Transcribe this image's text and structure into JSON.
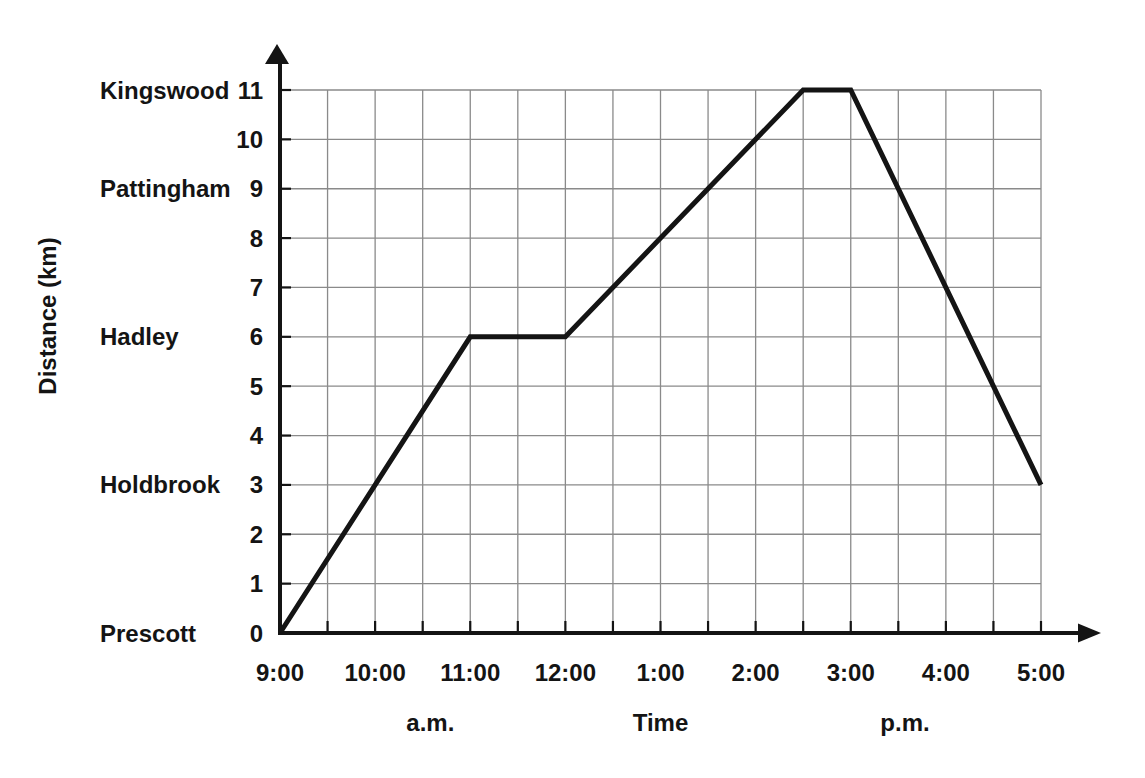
{
  "chart_data": {
    "type": "line",
    "title": "",
    "xlabel": "Time",
    "ylabel": "Distance (km)",
    "grid": true,
    "legend": false,
    "x_axis": {
      "range_hours": [
        9,
        17
      ],
      "grid_step_hours": 0.5,
      "ticks": [
        {
          "hour": 9,
          "label": "9:00"
        },
        {
          "hour": 10,
          "label": "10:00"
        },
        {
          "hour": 11,
          "label": "11:00"
        },
        {
          "hour": 12,
          "label": "12:00"
        },
        {
          "hour": 13,
          "label": "1:00"
        },
        {
          "hour": 14,
          "label": "2:00"
        },
        {
          "hour": 15,
          "label": "3:00"
        },
        {
          "hour": 16,
          "label": "4:00"
        },
        {
          "hour": 17,
          "label": "5:00"
        }
      ],
      "period_labels": [
        {
          "text": "a.m.",
          "at_hour": 10.58,
          "is_axis_title": false
        },
        {
          "text": "Time",
          "at_hour": 13.0,
          "is_axis_title": true
        },
        {
          "text": "p.m.",
          "at_hour": 15.57,
          "is_axis_title": false
        }
      ]
    },
    "y_axis": {
      "range_km": [
        0,
        11
      ],
      "grid_step_km": 1,
      "tick_labels": [
        "0",
        "1",
        "2",
        "3",
        "4",
        "5",
        "6",
        "7",
        "8",
        "9",
        "10",
        "11"
      ],
      "station_labels": [
        {
          "name": "Kingswood",
          "km": 11
        },
        {
          "name": "Pattingham",
          "km": 9
        },
        {
          "name": "Hadley",
          "km": 6
        },
        {
          "name": "Holdbrook",
          "km": 3
        },
        {
          "name": "Prescott",
          "km": 0
        }
      ]
    },
    "series": [
      {
        "name": "journey",
        "points": [
          {
            "hour": 9,
            "km": 0
          },
          {
            "hour": 11,
            "km": 6
          },
          {
            "hour": 12,
            "km": 6
          },
          {
            "hour": 14.5,
            "km": 11
          },
          {
            "hour": 15,
            "km": 11
          },
          {
            "hour": 17,
            "km": 3
          }
        ]
      }
    ],
    "colors": {
      "line": "#141414",
      "axis": "#141414",
      "grid": "#8a8a8a",
      "text": "#141414",
      "background": "#ffffff"
    }
  }
}
